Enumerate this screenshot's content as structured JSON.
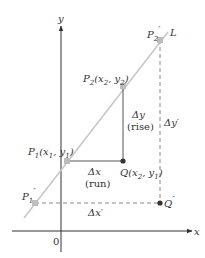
{
  "diagram": {
    "colors": {
      "axes": "#333333",
      "line_L": "#c8c8c8",
      "segments": "#555555",
      "dashed": "#888888",
      "point_on_line": "#bdbdbd",
      "point_dark": "#333333"
    },
    "axes": {
      "x_label": "x",
      "y_label": "y",
      "origin_label": "0"
    },
    "line_label": "L",
    "points": {
      "P1": {
        "name": "P",
        "sub": "1",
        "coords": "(x",
        "coords_sub1": "1",
        "coords_mid": ", y",
        "coords_sub2": "1",
        "coords_end": ")"
      },
      "P2": {
        "name": "P",
        "sub": "2",
        "coords": "(x",
        "coords_sub1": "2",
        "coords_mid": ", y",
        "coords_sub2": "2",
        "coords_end": ")"
      },
      "Q": {
        "name": "Q",
        "coords": "(x",
        "coords_sub1": "2",
        "coords_mid": ", y",
        "coords_sub2": "1",
        "coords_end": ")"
      },
      "P1_prime": {
        "name": "P",
        "sub": "1",
        "prime": "′"
      },
      "P2_prime": {
        "name": "P",
        "sub": "2",
        "prime": "′"
      },
      "Q_prime": {
        "name": "Q",
        "prime": "′"
      }
    },
    "annotations": {
      "delta_x": "Δx",
      "run": "(run)",
      "delta_y": "Δy",
      "rise": "(rise)",
      "delta_x_prime": "Δx′",
      "delta_y_prime": "Δy′"
    }
  }
}
